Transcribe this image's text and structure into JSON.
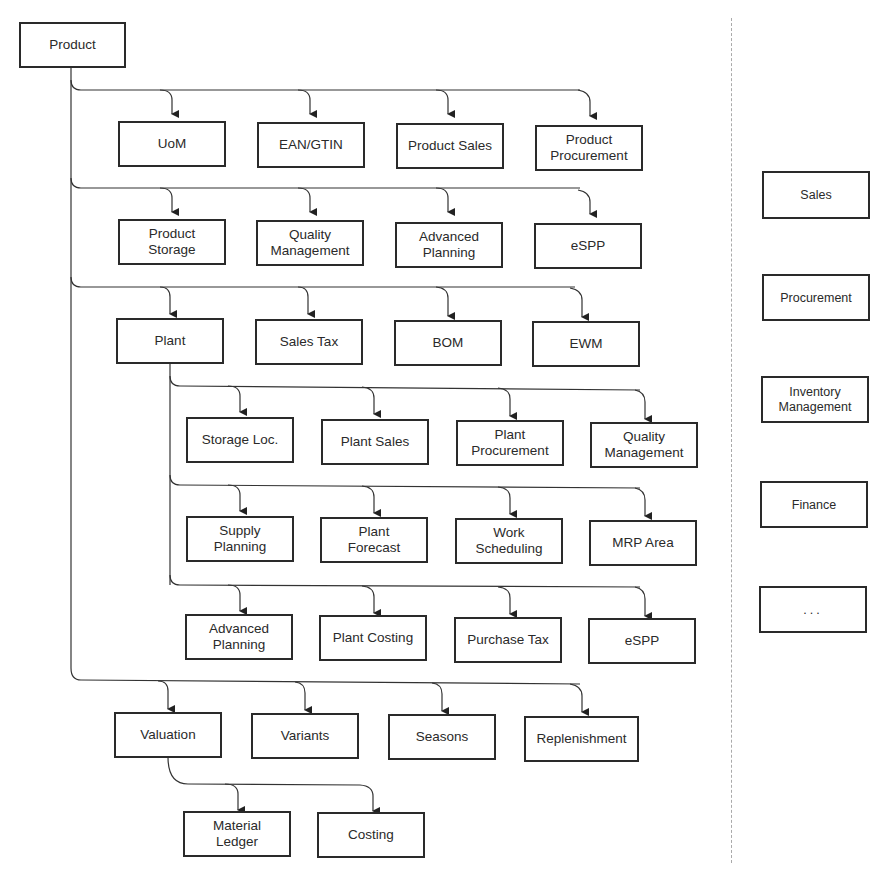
{
  "diagram": {
    "root": "Product",
    "product_children_row1": [
      "UoM",
      "EAN/GTIN",
      "Product Sales",
      "Product\nProcurement"
    ],
    "product_children_row2": [
      "Product\nStorage",
      "Quality\nManagement",
      "Advanced\nPlanning",
      "eSPP"
    ],
    "product_children_row3": [
      "Plant",
      "Sales Tax",
      "BOM",
      "EWM"
    ],
    "plant_children_row1": [
      "Storage Loc.",
      "Plant Sales",
      "Plant\nProcurement",
      "Quality\nManagement"
    ],
    "plant_children_row2": [
      "Supply\nPlanning",
      "Plant\nForecast",
      "Work\nScheduling",
      "MRP Area"
    ],
    "plant_children_row3": [
      "Advanced\nPlanning",
      "Plant Costing",
      "Purchase Tax",
      "eSPP"
    ],
    "product_children_row4": [
      "Valuation",
      "Variants",
      "Seasons",
      "Replenishment"
    ],
    "valuation_children": [
      "Material\nLedger",
      "Costing"
    ],
    "business_areas": [
      "Sales",
      "Procurement",
      "Inventory\nManagement",
      "Finance",
      "..."
    ]
  }
}
